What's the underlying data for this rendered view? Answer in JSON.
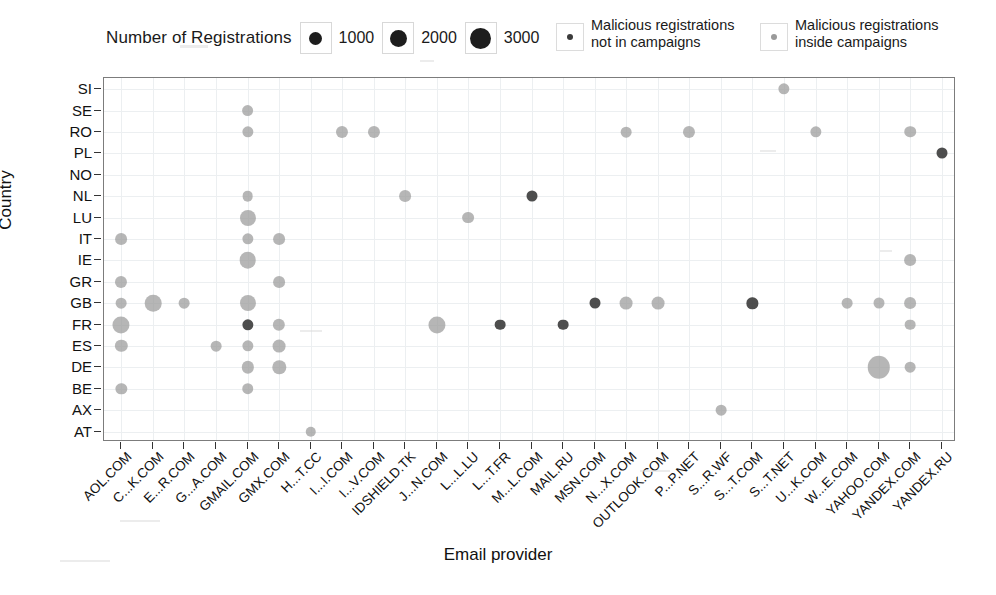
{
  "legend": {
    "size_title": "Number of Registrations",
    "size_keys": [
      {
        "label": "1000",
        "px": 13
      },
      {
        "label": "2000",
        "px": 17
      },
      {
        "label": "3000",
        "px": 21
      }
    ],
    "categories": [
      {
        "name": "not-in-campaigns",
        "label": "Malicious registrations\nnot in campaigns",
        "color": "#3b3b3b",
        "dot_px": 6
      },
      {
        "name": "inside-campaigns",
        "label": "Malicious registrations\ninside campaigns",
        "color": "#9a9a9a",
        "dot_px": 6
      }
    ]
  },
  "chart_data": {
    "type": "scatter",
    "title": "",
    "xlabel": "Email provider",
    "ylabel": "Country",
    "grid": true,
    "legend_position": "top",
    "size_legend_title": "Number of Registrations",
    "size_legend_values": [
      1000,
      2000,
      3000
    ],
    "series_names": [
      "Malicious registrations not in campaigns",
      "Malicious registrations inside campaigns"
    ],
    "categories_x": [
      "AOL.COM",
      "C...K.COM",
      "E...R.COM",
      "G...A.COM",
      "GMAIL.COM",
      "GMX.COM",
      "H...T.CC",
      "I...I.COM",
      "I...V.COM",
      "IDSHIELD.TK",
      "J...N.COM",
      "L...L.LU",
      "L...T.FR",
      "M...L.COM",
      "MAIL.RU",
      "MSN.COM",
      "N...X.COM",
      "OUTLOOK.COM",
      "P...P.NET",
      "S...R.WF",
      "S...T.COM",
      "S...T.NET",
      "U...K.COM",
      "W...E.COM",
      "YAHOO.COM",
      "YANDEX.COM",
      "YANDEX.RU"
    ],
    "categories_y": [
      "AT",
      "AX",
      "BE",
      "DE",
      "ES",
      "FR",
      "GB",
      "GR",
      "IE",
      "IT",
      "LU",
      "NL",
      "NO",
      "PL",
      "RO",
      "SE",
      "SI"
    ],
    "points": [
      {
        "x": "AOL.COM",
        "y": "IT",
        "size": 900,
        "series": "inside-campaigns"
      },
      {
        "x": "AOL.COM",
        "y": "GR",
        "size": 950,
        "series": "inside-campaigns"
      },
      {
        "x": "AOL.COM",
        "y": "GB",
        "size": 700,
        "series": "inside-campaigns"
      },
      {
        "x": "AOL.COM",
        "y": "FR",
        "size": 1900,
        "series": "inside-campaigns"
      },
      {
        "x": "AOL.COM",
        "y": "ES",
        "size": 1000,
        "series": "inside-campaigns"
      },
      {
        "x": "AOL.COM",
        "y": "BE",
        "size": 800,
        "series": "inside-campaigns"
      },
      {
        "x": "C...K.COM",
        "y": "GB",
        "size": 1800,
        "series": "inside-campaigns"
      },
      {
        "x": "E...R.COM",
        "y": "GB",
        "size": 700,
        "series": "inside-campaigns"
      },
      {
        "x": "G...A.COM",
        "y": "ES",
        "size": 700,
        "series": "inside-campaigns"
      },
      {
        "x": "GMAIL.COM",
        "y": "SE",
        "size": 900,
        "series": "inside-campaigns"
      },
      {
        "x": "GMAIL.COM",
        "y": "RO",
        "size": 800,
        "series": "inside-campaigns"
      },
      {
        "x": "GMAIL.COM",
        "y": "NL",
        "size": 700,
        "series": "inside-campaigns"
      },
      {
        "x": "GMAIL.COM",
        "y": "LU",
        "size": 1700,
        "series": "inside-campaigns"
      },
      {
        "x": "GMAIL.COM",
        "y": "IT",
        "size": 800,
        "series": "inside-campaigns"
      },
      {
        "x": "GMAIL.COM",
        "y": "IE",
        "size": 1800,
        "series": "inside-campaigns"
      },
      {
        "x": "GMAIL.COM",
        "y": "GB",
        "size": 1700,
        "series": "inside-campaigns"
      },
      {
        "x": "GMAIL.COM",
        "y": "FR",
        "size": 800,
        "series": "not-in-campaigns"
      },
      {
        "x": "GMAIL.COM",
        "y": "ES",
        "size": 800,
        "series": "inside-campaigns"
      },
      {
        "x": "GMAIL.COM",
        "y": "DE",
        "size": 1000,
        "series": "inside-campaigns"
      },
      {
        "x": "GMAIL.COM",
        "y": "BE",
        "size": 850,
        "series": "inside-campaigns"
      },
      {
        "x": "GMX.COM",
        "y": "IT",
        "size": 900,
        "series": "inside-campaigns"
      },
      {
        "x": "GMX.COM",
        "y": "GR",
        "size": 900,
        "series": "inside-campaigns"
      },
      {
        "x": "GMX.COM",
        "y": "FR",
        "size": 1000,
        "series": "inside-campaigns"
      },
      {
        "x": "GMX.COM",
        "y": "ES",
        "size": 1100,
        "series": "inside-campaigns"
      },
      {
        "x": "GMX.COM",
        "y": "DE",
        "size": 1200,
        "series": "inside-campaigns"
      },
      {
        "x": "H...T.CC",
        "y": "AT",
        "size": 650,
        "series": "inside-campaigns"
      },
      {
        "x": "I...I.COM",
        "y": "RO",
        "size": 950,
        "series": "inside-campaigns"
      },
      {
        "x": "I...V.COM",
        "y": "RO",
        "size": 950,
        "series": "inside-campaigns"
      },
      {
        "x": "IDSHIELD.TK",
        "y": "NL",
        "size": 900,
        "series": "inside-campaigns"
      },
      {
        "x": "J...N.COM",
        "y": "FR",
        "size": 1900,
        "series": "inside-campaigns"
      },
      {
        "x": "L...L.LU",
        "y": "LU",
        "size": 900,
        "series": "inside-campaigns"
      },
      {
        "x": "L...T.FR",
        "y": "FR",
        "size": 700,
        "series": "not-in-campaigns"
      },
      {
        "x": "M...L.COM",
        "y": "NL",
        "size": 750,
        "series": "not-in-campaigns"
      },
      {
        "x": "MAIL.RU",
        "y": "FR",
        "size": 700,
        "series": "not-in-campaigns"
      },
      {
        "x": "MSN.COM",
        "y": "GB",
        "size": 750,
        "series": "not-in-campaigns"
      },
      {
        "x": "N...X.COM",
        "y": "RO",
        "size": 700,
        "series": "inside-campaigns"
      },
      {
        "x": "N...X.COM",
        "y": "GB",
        "size": 1100,
        "series": "inside-campaigns"
      },
      {
        "x": "OUTLOOK.COM",
        "y": "GB",
        "size": 1100,
        "series": "inside-campaigns"
      },
      {
        "x": "P...P.NET",
        "y": "RO",
        "size": 950,
        "series": "inside-campaigns"
      },
      {
        "x": "S...R.WF",
        "y": "AX",
        "size": 700,
        "series": "inside-campaigns"
      },
      {
        "x": "S...T.COM",
        "y": "GB",
        "size": 800,
        "series": "not-in-campaigns"
      },
      {
        "x": "S...T.NET",
        "y": "SI",
        "size": 800,
        "series": "inside-campaigns"
      },
      {
        "x": "U...K.COM",
        "y": "RO",
        "size": 800,
        "series": "inside-campaigns"
      },
      {
        "x": "W...E.COM",
        "y": "GB",
        "size": 700,
        "series": "inside-campaigns"
      },
      {
        "x": "YAHOO.COM",
        "y": "GB",
        "size": 750,
        "series": "inside-campaigns"
      },
      {
        "x": "YAHOO.COM",
        "y": "DE",
        "size": 2900,
        "series": "inside-campaigns"
      },
      {
        "x": "YANDEX.COM",
        "y": "RO",
        "size": 850,
        "series": "inside-campaigns"
      },
      {
        "x": "YANDEX.COM",
        "y": "IE",
        "size": 900,
        "series": "inside-campaigns"
      },
      {
        "x": "YANDEX.COM",
        "y": "GB",
        "size": 900,
        "series": "inside-campaigns"
      },
      {
        "x": "YANDEX.COM",
        "y": "FR",
        "size": 700,
        "series": "inside-campaigns"
      },
      {
        "x": "YANDEX.COM",
        "y": "DE",
        "size": 700,
        "series": "inside-campaigns"
      },
      {
        "x": "YANDEX.RU",
        "y": "PL",
        "size": 750,
        "series": "not-in-campaigns"
      }
    ]
  }
}
